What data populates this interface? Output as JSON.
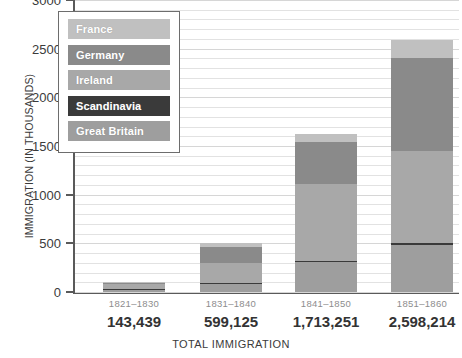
{
  "chart_data": {
    "type": "bar",
    "title": "",
    "subtitle": "",
    "xlabel": "TOTAL IMMIGRATION",
    "ylabel": "IMMIGRATION (IN THOUSANDS)",
    "ylim": [
      0,
      3000
    ],
    "yticks": [
      0,
      500,
      1000,
      1500,
      2000,
      2500,
      3000
    ],
    "ytick_labels": [
      "0",
      "500",
      "1000",
      "1500",
      "2000",
      "2500",
      "3000"
    ],
    "grid": true,
    "stacked": true,
    "legend_position": "upper-left-inset",
    "categories": [
      "1821–1830",
      "1831–1840",
      "1841–1850",
      "1851–1860"
    ],
    "category_totals_text": [
      "143,439",
      "599,125",
      "1,713,251",
      "2,598,214"
    ],
    "category_totals": [
      143439,
      599125,
      1713251,
      2598214
    ],
    "series": [
      {
        "name": "Great Britain",
        "color": "#9e9e9e",
        "values": [
          30,
          80,
          305,
          485
        ]
      },
      {
        "name": "Scandinavia",
        "color": "#3a3a3a",
        "values": [
          4,
          8,
          14,
          18
        ]
      },
      {
        "name": "Ireland",
        "color": "#a8a8a8",
        "values": [
          55,
          210,
          790,
          950
        ]
      },
      {
        "name": "Germany",
        "color": "#8a8a8a",
        "values": [
          8,
          160,
          435,
          955
        ]
      },
      {
        "name": "France",
        "color": "#c0c0c0",
        "values": [
          10,
          45,
          80,
          185
        ]
      }
    ],
    "annotations": [
      "Top y-axis label 3000 is clipped at image edge",
      "First period label is partially blurred in source"
    ]
  },
  "legend": {
    "items": [
      {
        "label": "France",
        "color": "#c0c0c0"
      },
      {
        "label": "Germany",
        "color": "#8a8a8a"
      },
      {
        "label": "Ireland",
        "color": "#a8a8a8"
      },
      {
        "label": "Scandinavia",
        "color": "#3a3a3a"
      },
      {
        "label": "Great Britain",
        "color": "#9e9e9e"
      }
    ]
  },
  "axes": {
    "y_title": "IMMIGRATION (IN THOUSANDS)",
    "x_title": "TOTAL IMMIGRATION"
  },
  "colors": {
    "axis": "#5a5a5a",
    "grid": "#e2e2e2",
    "text": "#3b3b3b",
    "muted_text": "#8d8d8d",
    "background": "#ffffff"
  }
}
